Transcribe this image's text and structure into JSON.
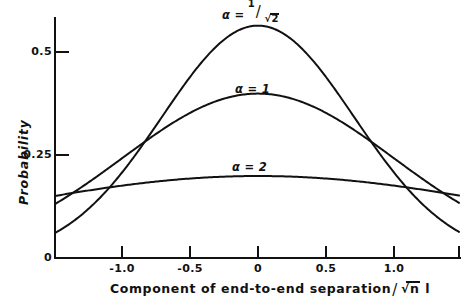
{
  "chart_data": {
    "type": "line",
    "title": "",
    "xlabel": "Component of end-to-end separation/√n l",
    "ylabel": "Probability",
    "xlim": [
      -1.48,
      1.48
    ],
    "ylim": [
      0,
      0.6
    ],
    "grid": false,
    "legend_position": "inline-annotations",
    "x_ticks": [
      {
        "value": -1.0,
        "label": "-1.0"
      },
      {
        "value": -0.5,
        "label": "-0.5"
      },
      {
        "value": 0,
        "label": "0"
      },
      {
        "value": 0.5,
        "label": "0.5"
      },
      {
        "value": 1.0,
        "label": "1.0"
      }
    ],
    "y_ticks": [
      {
        "value": 0,
        "label": "0"
      },
      {
        "value": 0.25,
        "label": "0.25"
      },
      {
        "value": 0.5,
        "label": "0.5"
      }
    ],
    "series": [
      {
        "name": "alpha = 1/sqrt(2)",
        "label_text": "α = 1/√2",
        "alpha": 0.7071,
        "peak_value": 0.564,
        "annotation": {
          "x": 0.0,
          "y": 0.6
        }
      },
      {
        "name": "alpha = 1",
        "label_text": "α = 1",
        "alpha": 1.0,
        "peak_value": 0.399,
        "annotation": {
          "x": -0.06,
          "y": 0.445
        }
      },
      {
        "name": "alpha = 2",
        "label_text": "α = 2",
        "alpha": 2.0,
        "peak_value": 0.199,
        "annotation": {
          "x": -0.07,
          "y": 0.243
        }
      }
    ]
  },
  "axis": {
    "y_title": "Probability",
    "y_tick_0": "0",
    "y_tick_025": "0.25",
    "y_tick_05": "0.5",
    "x_tick_neg1": "-1.0",
    "x_tick_neg05": "-0.5",
    "x_tick_0": "0",
    "x_tick_05": "0.5",
    "x_tick_1": "1.0"
  },
  "xlabel_parts": {
    "main": "Component of end-to-end separation",
    "slash": "/",
    "radicand": "n",
    "unit": "l"
  },
  "series_labels": {
    "alpha_sym_1": "α =",
    "alpha_sym_2": "α = 1",
    "alpha_sym_3": "α = 2",
    "frac_num": "1",
    "frac_den": "2"
  },
  "colors": {
    "ink": "#111111",
    "background": "#ffffff"
  }
}
